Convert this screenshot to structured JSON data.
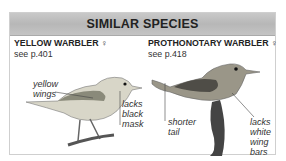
{
  "title": "SIMILAR SPECIES",
  "species": [
    {
      "name": "YELLOW WARBLER ♀",
      "page_ref": "see p.401",
      "annotations": [
        "yellow wings",
        "lacks black mask"
      ]
    },
    {
      "name": "PROTHONOTARY WARBLER ♀",
      "page_ref": "see p.418",
      "annotations": [
        "shorter tail",
        "lacks white wing bars"
      ]
    }
  ],
  "labels": {
    "yw_note1_l1": "yellow",
    "yw_note1_l2": "wings",
    "yw_note2_l1": "lacks",
    "yw_note2_l2": "black",
    "yw_note2_l3": "mask",
    "pw_note1_l1": "shorter",
    "pw_note1_l2": "tail",
    "pw_note2_l1": "lacks",
    "pw_note2_l2": "white",
    "pw_note2_l3": "wing",
    "pw_note2_l4": "bars"
  }
}
